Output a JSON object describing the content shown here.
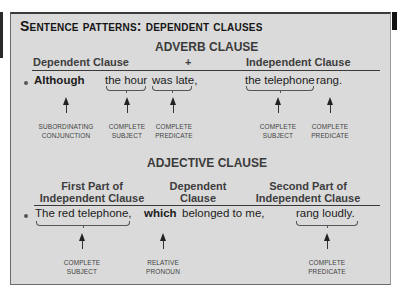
{
  "title": "Sentence patterns: dependent clauses",
  "adverb": {
    "section_title": "ADVERB CLAUSE",
    "headers": {
      "dependent": "Dependent Clause",
      "plus": "+",
      "independent": "Independent Clause"
    },
    "sentence": {
      "bullet": "•",
      "conjunction": "Although",
      "subject": "the hour",
      "predicate": "was late,",
      "main_subject": "the telephone",
      "main_predicate": "rang."
    },
    "labels": {
      "subordinating_1": "SUBORDINATING",
      "subordinating_2": "CONJUNCTION",
      "subject_1": "COMPLETE",
      "subject_2": "SUBJECT",
      "predicate_1": "COMPLETE",
      "predicate_2": "PREDICATE",
      "main_subject_1": "COMPLETE",
      "main_subject_2": "SUBJECT",
      "main_predicate_1": "COMPLETE",
      "main_predicate_2": "PREDICATE"
    }
  },
  "adjective": {
    "section_title": "ADJECTIVE CLAUSE",
    "headers": {
      "first_1": "First Part of",
      "first_2": "Independent Clause",
      "dependent_1": "Dependent",
      "dependent_2": "Clause",
      "second_1": "Second Part of",
      "second_2": "Independent Clause"
    },
    "sentence": {
      "bullet": "•",
      "subject": "The red telephone,",
      "pronoun": "which",
      "rest": "belonged to me,",
      "predicate": "rang loudly."
    },
    "labels": {
      "subject_1": "COMPLETE",
      "subject_2": "SUBJECT",
      "pronoun_1": "RELATIVE",
      "pronoun_2": "PRONOUN",
      "predicate_1": "COMPLETE",
      "predicate_2": "PREDICATE"
    }
  }
}
